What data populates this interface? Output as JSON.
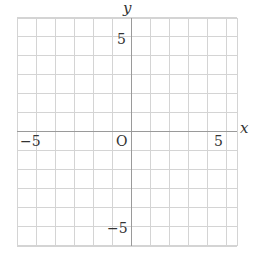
{
  "diagram": {
    "type": "coordinate-plane",
    "x_axis_label": "x",
    "y_axis_label": "y",
    "origin_label": "O",
    "x_range": [
      -6,
      6
    ],
    "y_range": [
      -6,
      6
    ],
    "grid_step": 1,
    "tick_labels": {
      "x_neg": "−5",
      "x_pos": "5",
      "y_pos": "5",
      "y_neg": "−5"
    },
    "colors": {
      "grid": "#d4d4d4",
      "axis": "#9a9a9a",
      "text": "#333333"
    }
  }
}
